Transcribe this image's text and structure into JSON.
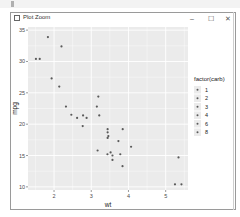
{
  "window": {
    "title": "Plot Zoom",
    "minimize_icon": "minimize-icon",
    "maximize_icon": "maximize-icon",
    "close_icon": "close-icon",
    "minimize_glyph": "–",
    "maximize_glyph": "☐",
    "close_glyph": "✕"
  },
  "colors": {
    "panel_bg": "#ebebeb",
    "grid": "#ffffff",
    "point": "#595959"
  },
  "chart_data": {
    "type": "scatter",
    "title": "",
    "xlabel": "wt",
    "ylabel": "mpg",
    "xlim": [
      1.3,
      5.6
    ],
    "ylim": [
      9.5,
      35.5
    ],
    "x_ticks": [
      2,
      3,
      4,
      5
    ],
    "y_ticks": [
      10,
      15,
      20,
      25,
      30,
      35
    ],
    "grid": true,
    "legend": {
      "title": "factor(carb)",
      "position": "right",
      "entries": [
        "1",
        "2",
        "3",
        "4",
        "6",
        "8"
      ]
    },
    "points": [
      {
        "wt": 2.62,
        "mpg": 21.0,
        "carb": "4"
      },
      {
        "wt": 2.875,
        "mpg": 21.0,
        "carb": "4"
      },
      {
        "wt": 2.32,
        "mpg": 22.8,
        "carb": "1"
      },
      {
        "wt": 3.215,
        "mpg": 21.4,
        "carb": "1"
      },
      {
        "wt": 3.44,
        "mpg": 18.7,
        "carb": "2"
      },
      {
        "wt": 3.46,
        "mpg": 18.1,
        "carb": "1"
      },
      {
        "wt": 3.57,
        "mpg": 14.3,
        "carb": "4"
      },
      {
        "wt": 3.19,
        "mpg": 24.4,
        "carb": "2"
      },
      {
        "wt": 3.15,
        "mpg": 22.8,
        "carb": "2"
      },
      {
        "wt": 3.44,
        "mpg": 19.2,
        "carb": "4"
      },
      {
        "wt": 3.44,
        "mpg": 17.8,
        "carb": "4"
      },
      {
        "wt": 4.07,
        "mpg": 16.4,
        "carb": "3"
      },
      {
        "wt": 3.73,
        "mpg": 17.3,
        "carb": "3"
      },
      {
        "wt": 3.78,
        "mpg": 15.2,
        "carb": "3"
      },
      {
        "wt": 5.25,
        "mpg": 10.4,
        "carb": "4"
      },
      {
        "wt": 5.424,
        "mpg": 10.4,
        "carb": "4"
      },
      {
        "wt": 5.345,
        "mpg": 14.7,
        "carb": "4"
      },
      {
        "wt": 2.2,
        "mpg": 32.4,
        "carb": "1"
      },
      {
        "wt": 1.615,
        "mpg": 30.4,
        "carb": "2"
      },
      {
        "wt": 1.835,
        "mpg": 33.9,
        "carb": "1"
      },
      {
        "wt": 2.465,
        "mpg": 21.5,
        "carb": "1"
      },
      {
        "wt": 3.52,
        "mpg": 15.5,
        "carb": "2"
      },
      {
        "wt": 3.435,
        "mpg": 15.2,
        "carb": "2"
      },
      {
        "wt": 3.84,
        "mpg": 13.3,
        "carb": "4"
      },
      {
        "wt": 3.845,
        "mpg": 19.2,
        "carb": "2"
      },
      {
        "wt": 1.935,
        "mpg": 27.3,
        "carb": "1"
      },
      {
        "wt": 2.14,
        "mpg": 26.0,
        "carb": "2"
      },
      {
        "wt": 1.513,
        "mpg": 30.4,
        "carb": "2"
      },
      {
        "wt": 3.17,
        "mpg": 15.8,
        "carb": "4"
      },
      {
        "wt": 2.77,
        "mpg": 19.7,
        "carb": "6"
      },
      {
        "wt": 3.57,
        "mpg": 15.0,
        "carb": "8"
      },
      {
        "wt": 2.78,
        "mpg": 21.4,
        "carb": "2"
      }
    ]
  }
}
